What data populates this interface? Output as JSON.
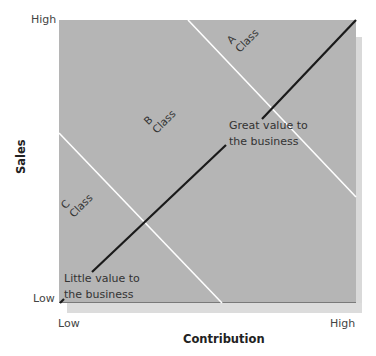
{
  "diagram": {
    "type": "sales-contribution-matrix",
    "colors": {
      "plot_fill": "#b5b5b5",
      "diagonal": "#1a1a1a",
      "class_boundaries": "#ffffff"
    },
    "y_axis": {
      "title": "Sales",
      "low_label": "Low",
      "high_label": "High"
    },
    "x_axis": {
      "title": "Contribution",
      "low_label": "Low",
      "high_label": "High"
    },
    "classes": [
      {
        "letter": "A",
        "word": "Class"
      },
      {
        "letter": "B",
        "word": "Class"
      },
      {
        "letter": "C",
        "word": "Class"
      }
    ],
    "annotations": {
      "great_value": {
        "line1": "Great value to",
        "line2": "the business"
      },
      "little_value": {
        "line1": "Little value to",
        "line2": "the business"
      }
    }
  }
}
